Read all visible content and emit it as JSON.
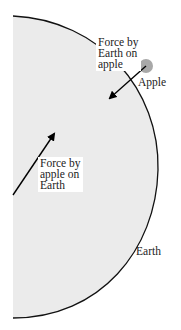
{
  "diagram": {
    "title": "",
    "colors": {
      "earth_fill": "#ebebeb",
      "earth_outline": "#111111",
      "apple": "#a8a8a8",
      "arrow": "#000000"
    },
    "labels": {
      "force_on_apple": [
        "Force by",
        "Earth on",
        "apple"
      ],
      "force_on_earth": [
        "Force by",
        "apple on",
        "Earth"
      ],
      "apple": "Apple",
      "earth": "Earth"
    }
  }
}
